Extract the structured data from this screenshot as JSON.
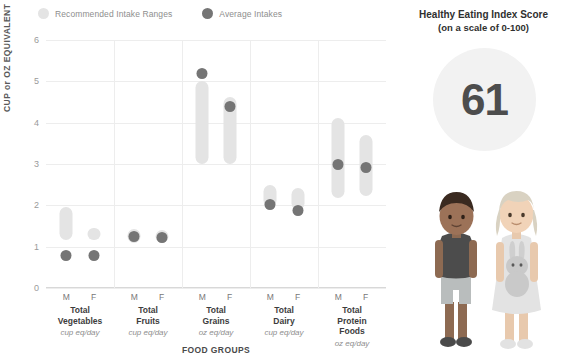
{
  "legend": {
    "items": [
      {
        "label": "Recommended Intake Ranges",
        "color": "#e4e4e4",
        "name": "recommended-intake-ranges"
      },
      {
        "label": "Average Intakes",
        "color": "#757575",
        "name": "average-intakes"
      }
    ]
  },
  "score_panel": {
    "title_line1": "Healthy Eating Index Score",
    "title_line2": "(on a scale of 0-100)",
    "score": "61",
    "circle_color": "#f2f2f2",
    "score_color": "#4d4d4d",
    "illustration": "two-children-boy-and-girl-holding-bunny"
  },
  "chart_data": {
    "type": "bar",
    "title": "",
    "xlabel": "FOOD GROUPS",
    "ylabel": "CUP or OZ EQUIVALENT",
    "ylim": [
      0,
      6
    ],
    "yticks": [
      0,
      1,
      2,
      3,
      4,
      5,
      6
    ],
    "grid": true,
    "legend_position": "top-left",
    "categories": [
      "Total Vegetables",
      "Total Fruits",
      "Total Grains",
      "Total Dairy",
      "Total Protein Foods"
    ],
    "units": [
      "cup eq/day",
      "cup eq/day",
      "oz eq/day",
      "cup eq/day",
      "oz eq/day"
    ],
    "sex_labels": [
      "M",
      "F"
    ],
    "groups": [
      {
        "name": "Total Vegetables",
        "unit": "cup eq/day",
        "series": [
          {
            "sex": "M",
            "range": [
              1.15,
              1.95
            ],
            "average": 0.78
          },
          {
            "sex": "F",
            "range": [
              1.15,
              1.45
            ],
            "average": 0.78
          }
        ]
      },
      {
        "name": "Total Fruits",
        "unit": "cup eq/day",
        "series": [
          {
            "sex": "M",
            "range": [
              1.1,
              1.42
            ],
            "average": 1.25
          },
          {
            "sex": "F",
            "range": [
              1.1,
              1.4
            ],
            "average": 1.23
          }
        ]
      },
      {
        "name": "Total Grains",
        "unit": "oz eq/day",
        "series": [
          {
            "sex": "M",
            "range": [
              3.0,
              5.0
            ],
            "average": 5.18
          },
          {
            "sex": "F",
            "range": [
              3.0,
              4.62
            ],
            "average": 4.38
          }
        ]
      },
      {
        "name": "Total Dairy",
        "unit": "cup eq/day",
        "series": [
          {
            "sex": "M",
            "range": [
              1.95,
              2.5
            ],
            "average": 2.02
          },
          {
            "sex": "F",
            "range": [
              1.88,
              2.42
            ],
            "average": 1.88
          }
        ]
      },
      {
        "name": "Total Protein Foods",
        "unit": "oz eq/day",
        "series": [
          {
            "sex": "M",
            "range": [
              2.18,
              4.12
            ],
            "average": 3.0
          },
          {
            "sex": "F",
            "range": [
              2.22,
              3.7
            ],
            "average": 2.92
          }
        ]
      }
    ],
    "colors": {
      "range": "#e4e4e4",
      "average": "#757575",
      "grid": "#ededed"
    }
  }
}
